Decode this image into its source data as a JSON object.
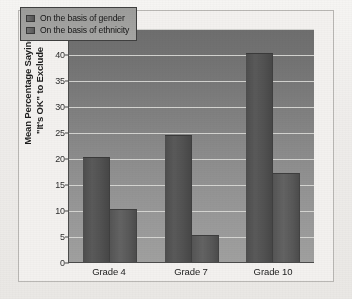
{
  "chart_data": {
    "type": "bar",
    "title": "",
    "subtitle": "",
    "xlabel": "",
    "ylabel": "Mean Percentage Saying \"It's OK\" to Exclude",
    "ylabel_line1": "Mean Percentage Saying",
    "ylabel_line2": "\"It's OK\" to Exclude",
    "categories": [
      "Grade 4",
      "Grade 7",
      "Grade 10"
    ],
    "ylim": [
      0,
      45
    ],
    "ytick_step": 5,
    "yticks": [
      "45",
      "40",
      "35",
      "30",
      "25",
      "20",
      "15",
      "10",
      "5",
      "0"
    ],
    "ytick_values": [
      45,
      40,
      35,
      30,
      25,
      20,
      15,
      10,
      5,
      0
    ],
    "grid": true,
    "grid_axis": "y",
    "legend_position": "top-left",
    "series": [
      {
        "name": "On the basis of gender",
        "key": "gender",
        "color": "#545454",
        "values": [
          20.2,
          24.5,
          40.2
        ]
      },
      {
        "name": "On the basis of ethnicity",
        "key": "ethnicity",
        "color": "#5a5a5a",
        "values": [
          10.1,
          5.1,
          17.1
        ]
      }
    ]
  },
  "legend": {
    "items": [
      {
        "label": "On the basis of gender",
        "swatch": "gender-swatch"
      },
      {
        "label": "On the basis of ethnicity",
        "swatch": "ethnicity-swatch"
      }
    ]
  },
  "colors": {
    "plot_top": "#6e6e6e",
    "plot_bottom": "#a0a09f",
    "gridline": "#d9d9d6",
    "axis": "#4b4b4b",
    "bar_gender": "#545454",
    "bar_ethnicity": "#5a5a5a",
    "page": "#f3f1ef",
    "frame": "#b9b7b4",
    "text": "#1d1d1d"
  }
}
